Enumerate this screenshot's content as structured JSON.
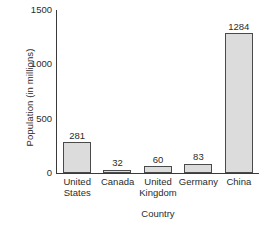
{
  "chart_data": {
    "type": "bar",
    "title": "",
    "xlabel": "Country",
    "ylabel": "Population (in millions)",
    "categories": [
      "United States",
      "Canada",
      "United Kingdom",
      "Germany",
      "China"
    ],
    "category_lines": [
      [
        "United",
        "States"
      ],
      [
        "Canada"
      ],
      [
        "United",
        "Kingdom"
      ],
      [
        "Germany"
      ],
      [
        "China"
      ]
    ],
    "values": [
      281,
      32,
      60,
      83,
      1284
    ],
    "value_labels": [
      "281",
      "32",
      "60",
      "83",
      "1284"
    ],
    "ylim": [
      0,
      1500
    ],
    "yticks": [
      0,
      500,
      1000,
      1500
    ],
    "ytick_labels": [
      "0",
      "500",
      "1000",
      "1500"
    ],
    "grid": false,
    "legend": false,
    "bar_fill_color": "#dcdcdc",
    "bar_edge_color": "#4a4a4a",
    "axis_color": "#3a3a3a",
    "text_color": "#2b2b2b",
    "background_color": "#ffffff"
  }
}
